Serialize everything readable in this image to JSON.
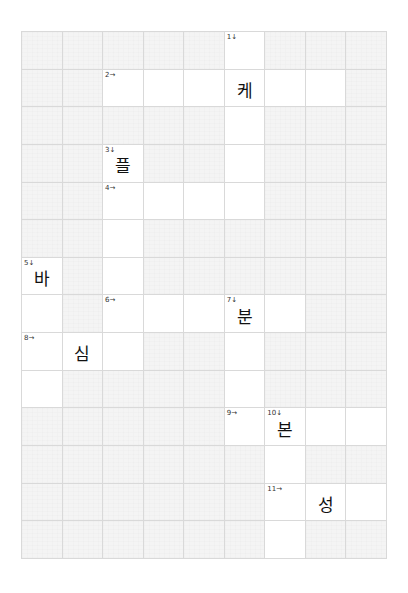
{
  "puzzle": {
    "cols": 9,
    "rows": 14,
    "colors": {
      "active_cell": "#ffffff",
      "blocked_cell": "#f4f4f4",
      "grid_line": "#d9d9d9",
      "text": "#111111"
    },
    "cells": [
      {
        "r": 0,
        "c": 5,
        "num": "1↓",
        "letter": ""
      },
      {
        "r": 1,
        "c": 2,
        "num": "2→",
        "letter": ""
      },
      {
        "r": 1,
        "c": 3,
        "num": "",
        "letter": ""
      },
      {
        "r": 1,
        "c": 4,
        "num": "",
        "letter": ""
      },
      {
        "r": 1,
        "c": 5,
        "num": "",
        "letter": "케"
      },
      {
        "r": 1,
        "c": 6,
        "num": "",
        "letter": ""
      },
      {
        "r": 1,
        "c": 7,
        "num": "",
        "letter": ""
      },
      {
        "r": 2,
        "c": 5,
        "num": "",
        "letter": ""
      },
      {
        "r": 3,
        "c": 2,
        "num": "3↓",
        "letter": "플"
      },
      {
        "r": 3,
        "c": 5,
        "num": "",
        "letter": ""
      },
      {
        "r": 4,
        "c": 2,
        "num": "4→",
        "letter": ""
      },
      {
        "r": 4,
        "c": 3,
        "num": "",
        "letter": ""
      },
      {
        "r": 4,
        "c": 4,
        "num": "",
        "letter": ""
      },
      {
        "r": 4,
        "c": 5,
        "num": "",
        "letter": ""
      },
      {
        "r": 5,
        "c": 2,
        "num": "",
        "letter": ""
      },
      {
        "r": 6,
        "c": 0,
        "num": "5↓",
        "letter": "바"
      },
      {
        "r": 6,
        "c": 2,
        "num": "",
        "letter": ""
      },
      {
        "r": 7,
        "c": 0,
        "num": "",
        "letter": ""
      },
      {
        "r": 7,
        "c": 2,
        "num": "6→",
        "letter": ""
      },
      {
        "r": 7,
        "c": 3,
        "num": "",
        "letter": ""
      },
      {
        "r": 7,
        "c": 4,
        "num": "",
        "letter": ""
      },
      {
        "r": 7,
        "c": 5,
        "num": "7↓",
        "letter": "분"
      },
      {
        "r": 7,
        "c": 6,
        "num": "",
        "letter": ""
      },
      {
        "r": 8,
        "c": 0,
        "num": "8→",
        "letter": ""
      },
      {
        "r": 8,
        "c": 1,
        "num": "",
        "letter": "심"
      },
      {
        "r": 8,
        "c": 2,
        "num": "",
        "letter": ""
      },
      {
        "r": 8,
        "c": 5,
        "num": "",
        "letter": ""
      },
      {
        "r": 9,
        "c": 0,
        "num": "",
        "letter": ""
      },
      {
        "r": 9,
        "c": 5,
        "num": "",
        "letter": ""
      },
      {
        "r": 10,
        "c": 5,
        "num": "9→",
        "letter": ""
      },
      {
        "r": 10,
        "c": 6,
        "num": "10↓",
        "letter": "본"
      },
      {
        "r": 10,
        "c": 7,
        "num": "",
        "letter": ""
      },
      {
        "r": 10,
        "c": 8,
        "num": "",
        "letter": ""
      },
      {
        "r": 11,
        "c": 6,
        "num": "",
        "letter": ""
      },
      {
        "r": 12,
        "c": 6,
        "num": "11→",
        "letter": ""
      },
      {
        "r": 12,
        "c": 7,
        "num": "",
        "letter": "성"
      },
      {
        "r": 12,
        "c": 8,
        "num": "",
        "letter": ""
      },
      {
        "r": 13,
        "c": 6,
        "num": "",
        "letter": ""
      }
    ]
  }
}
